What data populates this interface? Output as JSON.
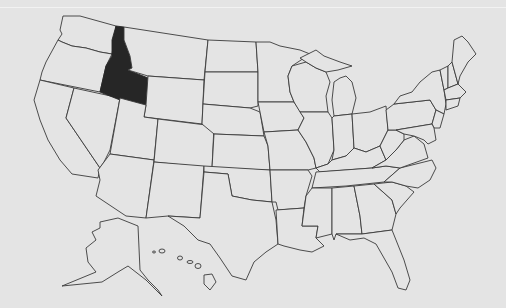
{
  "map": {
    "type": "choropleth",
    "region": "United States",
    "style": "state outline map, grayscale",
    "background_color": "#e4e4e4",
    "outline_color": "#3a3a3a",
    "highlight_color": "#262626",
    "highlighted_states": [
      "Idaho"
    ],
    "insets": [
      "Alaska",
      "Hawaii"
    ],
    "labels": []
  }
}
